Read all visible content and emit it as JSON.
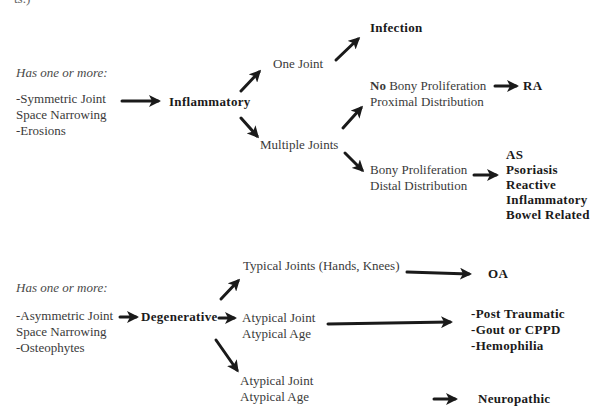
{
  "top_fragment": "ts.)",
  "inflammatory_section": {
    "criteria_heading": "Has one or more:",
    "criteria": [
      "-Symmetric Joint",
      "Space Narrowing",
      "-Erosions"
    ],
    "category": "Inflammatory",
    "branches": {
      "one_joint": {
        "label": "One Joint",
        "result": "Infection"
      },
      "multiple_joints": {
        "label": "Multiple Joints",
        "no_bony": {
          "line1_bold": "No",
          "line1_rest": " Bony Proliferation",
          "line2": "Proximal Distribution",
          "result": "RA"
        },
        "bony": {
          "line1": "Bony Proliferation",
          "line2": "Distal Distribution",
          "results": [
            "AS",
            "Psoriasis",
            "Reactive",
            "Inflammatory",
            "Bowel Related"
          ]
        }
      }
    }
  },
  "degenerative_section": {
    "criteria_heading": "Has one or more:",
    "criteria": [
      "-Asymmetric Joint",
      "Space Narrowing",
      "-Osteophytes"
    ],
    "category": "Degenerative",
    "branches": {
      "typical": {
        "label": "Typical Joints (Hands, Knees)",
        "result": "OA"
      },
      "atypical_1": {
        "line1": "Atypical Joint",
        "line2": "Atypical Age",
        "results": [
          "-Post Traumatic",
          "-Gout or CPPD",
          "-Hemophilia"
        ]
      },
      "atypical_2": {
        "line1": "Atypical Joint",
        "line2": "Atypical Age",
        "result": "Neuropathic"
      }
    }
  },
  "colors": {
    "arrow": "#1a1a1a",
    "text": "#3a3a3a",
    "bold_text": "#1a1a1a",
    "background": "#ffffff"
  }
}
